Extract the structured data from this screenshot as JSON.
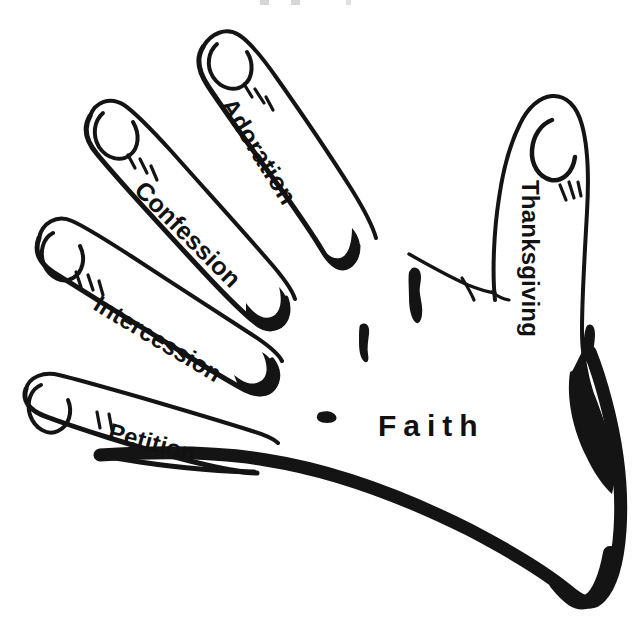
{
  "figure": {
    "background_color": "#ffffff",
    "ink_color": "#111111"
  },
  "labels": {
    "adoration": "Adoration",
    "confession": "Confession",
    "intercession": "Intercession",
    "petition": "Petition",
    "thanksgiving": "Thanksgiving",
    "faith": "Faith"
  },
  "parts": [
    {
      "name": "index-finger",
      "label": "Adoration",
      "rotation_deg": 58
    },
    {
      "name": "middle-finger",
      "label": "Confession",
      "rotation_deg": 45
    },
    {
      "name": "ring-finger",
      "label": "Intercession",
      "rotation_deg": 31
    },
    {
      "name": "little-finger",
      "label": "Petition",
      "rotation_deg": 15
    },
    {
      "name": "thumb",
      "label": "Thanksgiving",
      "rotation_deg": 90
    },
    {
      "name": "palm",
      "label": "Faith",
      "rotation_deg": 0
    }
  ]
}
